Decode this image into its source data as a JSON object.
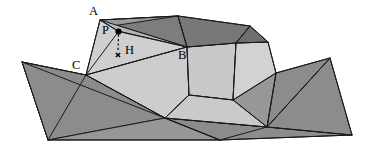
{
  "figure": {
    "type": "geometric-diagram",
    "width": 367,
    "height": 147,
    "background_color": "#ffffff",
    "labels": [
      {
        "id": "A",
        "text": "A",
        "x": 89,
        "y": 5
      },
      {
        "id": "P",
        "text": "P",
        "x": 102,
        "y": 24
      },
      {
        "id": "H",
        "text": "H",
        "x": 125,
        "y": 44
      },
      {
        "id": "C",
        "text": "C",
        "x": 72,
        "y": 59
      },
      {
        "id": "B",
        "text": "B",
        "x": 178,
        "y": 49
      }
    ],
    "markers": {
      "point_p": {
        "name": "P",
        "x": 118.5,
        "y": 31.5,
        "radius": 3.1,
        "style": "filled-dot",
        "color": "#000000"
      },
      "foot_h": {
        "name": "H",
        "x": 118.0,
        "y": 55.0,
        "size": 4.2,
        "style": "cross",
        "color": "#000000"
      },
      "drop_line": {
        "from": "P",
        "to": "H",
        "style": "dashed",
        "x1": 118.5,
        "y1": 34.6,
        "x2": 118.0,
        "y2": 51.6
      }
    },
    "palette": {
      "plane_dark": "#8c8c8c",
      "plane_mid": "#979797",
      "plane_light": "#a4a4a4",
      "solid_light": "#c9c9c9",
      "solid_lighter": "#d4d4d4",
      "solid_pale": "#dcdcdc",
      "ridge_dark": "#7e7e7e",
      "ridge_darker": "#6f6f6f",
      "edge_stroke": "#1a1a1a"
    },
    "faces": [
      {
        "name": "base-left-upper",
        "points": "22,62 86,75 48,140",
        "fill": "#8c8c8c"
      },
      {
        "name": "base-left-lower",
        "points": "22,62 86,75 165,118 48,140",
        "fill": "#8c8c8c"
      },
      {
        "name": "base-mid-lower",
        "points": "48,140 165,118 220,140",
        "fill": "#979797"
      },
      {
        "name": "base-right-lower",
        "points": "165,118 267,127 220,140",
        "fill": "#8c8c8c"
      },
      {
        "name": "base-right-fan-a",
        "points": "165,118 267,127 352,135 220,140",
        "fill": "#8c8c8c"
      },
      {
        "name": "base-right-fan-b",
        "points": "267,127 330,58 352,135",
        "fill": "#8c8c8c"
      },
      {
        "name": "base-right-fan-c",
        "points": "267,127 276,73 330,58",
        "fill": "#8c8c8c"
      },
      {
        "name": "base-strip-upper",
        "points": "86,75 276,73 267,127 165,118",
        "fill": "#979797"
      },
      {
        "name": "solid-face-CAB",
        "points": "86,75 100,20 187,47",
        "fill": "#cfcfcf"
      },
      {
        "name": "solid-face-CBmid",
        "points": "86,75 187,47 189,95 165,118",
        "fill": "#cdcdcd"
      },
      {
        "name": "solid-face-Bright",
        "points": "187,47 236,43 233,100 189,95",
        "fill": "#c9c9c9"
      },
      {
        "name": "solid-face-peak",
        "points": "236,43 268,42 276,73 233,100",
        "fill": "#d2d2d2"
      },
      {
        "name": "solid-face-lowmid",
        "points": "165,118 189,95 233,100 267,127",
        "fill": "#cacaca"
      },
      {
        "name": "ridge-face-left",
        "points": "100,20 178,16 187,47",
        "fill": "#7d7d7d"
      },
      {
        "name": "ridge-face-right",
        "points": "178,16 250,26 236,43 187,47",
        "fill": "#787878"
      },
      {
        "name": "ridge-face-cap",
        "points": "250,26 268,42 236,43",
        "fill": "#6f6f6f"
      },
      {
        "name": "sliver-A-ridge",
        "points": "100,20 112,26 178,16",
        "fill": "#9a9a9a"
      },
      {
        "name": "sliver-P-band",
        "points": "100,20 118,31 187,47",
        "fill": "#b5b5b5"
      }
    ],
    "edges": [
      {
        "name": "edge-A-C",
        "d": "M 100,20 L 86,75"
      },
      {
        "name": "edge-A-P",
        "d": "M 100,20 L 118.5,31.5"
      },
      {
        "name": "edge-P-C",
        "d": "M 118.5,31.5 L 86,75"
      },
      {
        "name": "edge-P-B",
        "d": "M 118.5,31.5 L 187,47"
      },
      {
        "name": "edge-A-ridgetop",
        "d": "M 100,20 L 178,16"
      },
      {
        "name": "edge-ridge-to-B",
        "d": "M 178,16 L 187,47"
      },
      {
        "name": "edge-ridge-top-right",
        "d": "M 178,16 L 250,26"
      },
      {
        "name": "edge-ridge-peak",
        "d": "M 250,26 L 268,42"
      },
      {
        "name": "edge-ridge-b-right",
        "d": "M 187,47 L 236,43"
      },
      {
        "name": "edge-236-250",
        "d": "M 236,43 L 250,26"
      },
      {
        "name": "edge-236-268",
        "d": "M 236,43 L 268,42"
      },
      {
        "name": "edge-C-B",
        "d": "M 86,75 L 187,47"
      },
      {
        "name": "edge-B-down",
        "d": "M 187,47 L 189,95"
      },
      {
        "name": "edge-236-233",
        "d": "M 236,43 L 233,100"
      },
      {
        "name": "edge-268-276",
        "d": "M 268,42 L 276,73"
      },
      {
        "name": "edge-189-233",
        "d": "M 189,95 L 233,100"
      },
      {
        "name": "edge-233-276",
        "d": "M 233,100 L 276,73"
      },
      {
        "name": "edge-C-165",
        "d": "M 86,75 L 165,118"
      },
      {
        "name": "edge-165-189",
        "d": "M 165,118 L 189,95"
      },
      {
        "name": "edge-233-267",
        "d": "M 233,100 L 267,127"
      },
      {
        "name": "edge-165-267",
        "d": "M 165,118 L 267,127"
      },
      {
        "name": "edge-276-267",
        "d": "M 276,73 L 267,127"
      },
      {
        "name": "edge-base-top-left",
        "d": "M 22,62 L 86,75"
      },
      {
        "name": "edge-base-top-right",
        "d": "M 276,73 L 330,58"
      },
      {
        "name": "edge-base-left",
        "d": "M 22,62 L 48,140"
      },
      {
        "name": "edge-base-bottom",
        "d": "M 48,140 L 220,140 L 352,135"
      },
      {
        "name": "edge-base-right",
        "d": "M 330,58 L 352,135"
      },
      {
        "name": "edge-base-diag-1",
        "d": "M 22,62 L 165,118"
      },
      {
        "name": "edge-base-diag-2",
        "d": "M 86,75 L 48,140"
      },
      {
        "name": "edge-base-diag-3",
        "d": "M 165,118 L 220,140"
      },
      {
        "name": "edge-base-diag-4",
        "d": "M 267,127 L 330,58"
      },
      {
        "name": "edge-base-diag-5",
        "d": "M 267,127 L 352,135"
      },
      {
        "name": "edge-base-diag-6",
        "d": "M 220,140 L 267,127"
      }
    ]
  }
}
